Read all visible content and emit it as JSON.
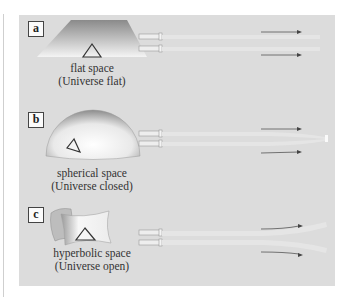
{
  "figure": {
    "panels": [
      {
        "id": "a",
        "label": "a",
        "title": "flat space",
        "subtitle": "(Universe flat)",
        "geometry": "flat",
        "beam_behavior": "parallel"
      },
      {
        "id": "b",
        "label": "b",
        "title": "spherical space",
        "subtitle": "(Universe closed)",
        "geometry": "spherical",
        "beam_behavior": "converging"
      },
      {
        "id": "c",
        "label": "c",
        "title": "hyperbolic space",
        "subtitle": "(Universe open)",
        "geometry": "hyperbolic",
        "beam_behavior": "diverging"
      }
    ],
    "colors": {
      "panel_background": "#dcdcdc",
      "beam": "#e6e6e6",
      "arrow": "#555555",
      "label_border": "#444444"
    }
  }
}
